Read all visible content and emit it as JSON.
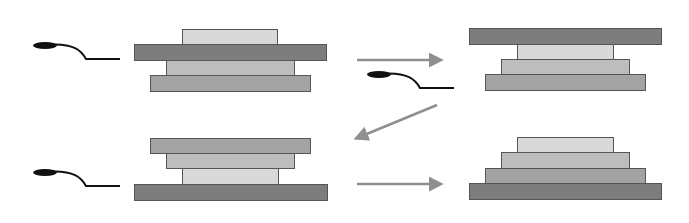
{
  "diagram": {
    "colors": {
      "background": "#ffffff",
      "plate_dark": "#7d7d7d",
      "plate_mid": "#a3a3a3",
      "plate_midlight": "#bdbdbd",
      "plate_light": "#d9d9d9",
      "plate_stroke": "#555555",
      "arrow": "#8f8f8f",
      "tool": "#111111"
    },
    "panels": [
      {
        "id": "step-1",
        "position": "top-left",
        "tool": {
          "x": 33,
          "y": 44
        },
        "plates": [
          {
            "name": "light",
            "x": 182,
            "y": 29,
            "w": 95,
            "h": 15,
            "color": "#d9d9d9"
          },
          {
            "name": "dark",
            "x": 134,
            "y": 44,
            "w": 192,
            "h": 16,
            "color": "#7d7d7d"
          },
          {
            "name": "midlight",
            "x": 166,
            "y": 60,
            "w": 128,
            "h": 15,
            "color": "#bdbdbd"
          },
          {
            "name": "mid",
            "x": 150,
            "y": 75,
            "w": 160,
            "h": 16,
            "color": "#a3a3a3"
          }
        ]
      },
      {
        "id": "step-2",
        "position": "top-right",
        "tool": {
          "x": 367,
          "y": 73
        },
        "plates": [
          {
            "name": "dark",
            "x": 469,
            "y": 28,
            "w": 192,
            "h": 16,
            "color": "#7d7d7d"
          },
          {
            "name": "light",
            "x": 517,
            "y": 44,
            "w": 96,
            "h": 15,
            "color": "#d9d9d9"
          },
          {
            "name": "midlight",
            "x": 501,
            "y": 59,
            "w": 128,
            "h": 15,
            "color": "#bdbdbd"
          },
          {
            "name": "mid",
            "x": 485,
            "y": 74,
            "w": 160,
            "h": 16,
            "color": "#a3a3a3"
          }
        ]
      },
      {
        "id": "step-3",
        "position": "bottom-left",
        "tool": {
          "x": 33,
          "y": 171
        },
        "plates": [
          {
            "name": "mid",
            "x": 150,
            "y": 138,
            "w": 160,
            "h": 15,
            "color": "#a3a3a3"
          },
          {
            "name": "midlight",
            "x": 166,
            "y": 153,
            "w": 128,
            "h": 15,
            "color": "#bdbdbd"
          },
          {
            "name": "light",
            "x": 182,
            "y": 168,
            "w": 96,
            "h": 16,
            "color": "#d9d9d9"
          },
          {
            "name": "dark",
            "x": 134,
            "y": 184,
            "w": 193,
            "h": 16,
            "color": "#7d7d7d"
          }
        ]
      },
      {
        "id": "step-4",
        "position": "bottom-right",
        "tool": null,
        "plates": [
          {
            "name": "light",
            "x": 517,
            "y": 137,
            "w": 96,
            "h": 15,
            "color": "#d9d9d9"
          },
          {
            "name": "midlight",
            "x": 501,
            "y": 152,
            "w": 128,
            "h": 16,
            "color": "#bdbdbd"
          },
          {
            "name": "mid",
            "x": 485,
            "y": 168,
            "w": 160,
            "h": 15,
            "color": "#a3a3a3"
          },
          {
            "name": "dark",
            "x": 469,
            "y": 183,
            "w": 192,
            "h": 16,
            "color": "#7d7d7d"
          }
        ]
      }
    ],
    "arrows": [
      {
        "id": "arrow-1-to-2",
        "direction": "right",
        "x1": 357,
        "y1": 60,
        "x2": 440,
        "y2": 60
      },
      {
        "id": "arrow-2-to-3",
        "direction": "down-left",
        "x1": 437,
        "y1": 105,
        "x2": 357,
        "y2": 138
      },
      {
        "id": "arrow-3-to-4",
        "direction": "right",
        "x1": 357,
        "y1": 184,
        "x2": 440,
        "y2": 184
      }
    ]
  }
}
